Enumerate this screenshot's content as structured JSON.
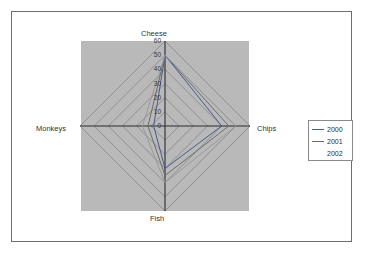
{
  "chart_data": {
    "type": "line",
    "subtype": "radar",
    "title": "",
    "xlabel": "",
    "ylabel": "",
    "categories": [
      "Cheese",
      "Chips",
      "Fish",
      "Monkeys"
    ],
    "tick_labels": [
      "60",
      "50",
      "40",
      "30",
      "20",
      "10",
      "0"
    ],
    "ylim": [
      0,
      60
    ],
    "tick_step": 10,
    "grid": true,
    "legend_position": "right",
    "plot_background": "#b9b9b9",
    "series": [
      {
        "name": "2000",
        "color": "#4a5a8c",
        "values": [
          50,
          40,
          30,
          8
        ]
      },
      {
        "name": "2001",
        "color": "#6d6d6d",
        "values": [
          50,
          45,
          35,
          12
        ]
      },
      {
        "name": "2002",
        "color": "#9a9a9a",
        "values": [
          50,
          50,
          40,
          16
        ]
      }
    ]
  },
  "chart": {
    "axis_labels": {
      "top": "Cheese",
      "right": "Chips",
      "bottom": "Fish",
      "left": "Monkeys"
    }
  },
  "legend": {
    "entries": [
      {
        "label": "2000"
      },
      {
        "label": "2001"
      },
      {
        "label": "2002"
      }
    ]
  }
}
